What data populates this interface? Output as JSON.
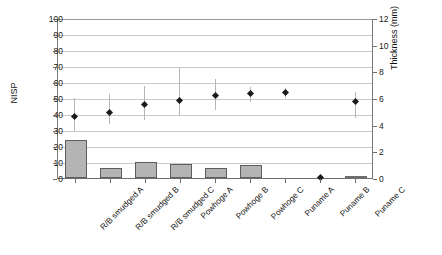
{
  "chart_data": {
    "type": "bar",
    "title": "",
    "subtitle": "",
    "categories": [
      "R/B smudged A",
      "R/B smudged B",
      "R/B smudged C",
      "Powhoge A",
      "Powhoge B",
      "Powhoge C",
      "Puname A",
      "Puname B",
      "Puname C"
    ],
    "xlabel": "",
    "ylabel": "NISP",
    "ylabel_secondary": "Thickness (mm)",
    "ylim": [
      0,
      100
    ],
    "ylim_secondary": [
      0,
      12
    ],
    "yticks": [
      0,
      10,
      20,
      30,
      40,
      50,
      60,
      70,
      80,
      90,
      100
    ],
    "yticks_secondary": [
      0,
      2,
      4,
      6,
      8,
      10,
      12
    ],
    "grid": true,
    "legend": "none",
    "series": [
      {
        "name": "NISP",
        "kind": "bar",
        "axis": "left",
        "color": "#b4b4b4",
        "edge_color": "#5d5d5d",
        "values": [
          24,
          6,
          10,
          9,
          6,
          8,
          0,
          0,
          0.5
        ]
      },
      {
        "name": "Thickness (mm)",
        "kind": "scatter",
        "axis": "right",
        "color": "#1b1b1b",
        "marker": "diamond",
        "values": [
          4.7,
          5.0,
          5.6,
          5.9,
          6.3,
          6.4,
          6.5,
          0.1,
          5.8
        ],
        "error_low": [
          3.6,
          4.1,
          4.4,
          4.7,
          5.2,
          5.8,
          6.1,
          0.1,
          4.6
        ],
        "error_high": [
          6.1,
          6.4,
          7.0,
          8.3,
          7.5,
          6.9,
          6.8,
          0.1,
          6.5
        ]
      }
    ]
  },
  "axes": {
    "left": {
      "title": "NISP",
      "ticks": [
        "100",
        "90",
        "80",
        "70",
        "60",
        "50",
        "40",
        "30",
        "20",
        "10",
        "0"
      ]
    },
    "right": {
      "title": "Thickness (mm)",
      "ticks": [
        "12",
        "10",
        "8",
        "6",
        "4",
        "2",
        "0"
      ]
    }
  }
}
